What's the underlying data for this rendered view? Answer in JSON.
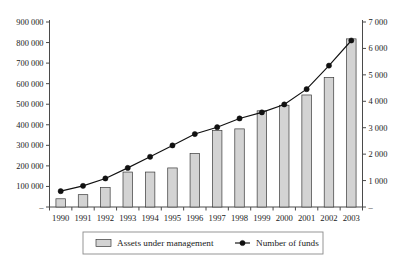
{
  "chart_data": {
    "type": "bar",
    "title": "",
    "subtitle": "",
    "xlabel": "",
    "ylabel": "",
    "grid": false,
    "legend_position": "bottom",
    "categories": [
      "1990",
      "1991",
      "1992",
      "1993",
      "1994",
      "1995",
      "1996",
      "1997",
      "1998",
      "1999",
      "2000",
      "2001",
      "2002",
      "2003"
    ],
    "left_axis": {
      "label": "",
      "ylim": [
        0,
        900000
      ],
      "tick_values": [
        0,
        100000,
        200000,
        300000,
        400000,
        500000,
        600000,
        700000,
        800000,
        900000
      ],
      "tick_labels": [
        "–",
        "100 000",
        "200 000",
        "300 000",
        "400 000",
        "500 000",
        "600 000",
        "700 000",
        "800 000",
        "900 000"
      ]
    },
    "right_axis": {
      "label": "",
      "ylim": [
        0,
        7000
      ],
      "tick_values": [
        0,
        1000,
        2000,
        3000,
        4000,
        5000,
        6000,
        7000
      ],
      "tick_labels": [
        "–",
        "1 000",
        "2 000",
        "3 000",
        "4 000",
        "5 000",
        "6 000",
        "7 000"
      ]
    },
    "series": [
      {
        "name": "Assets under management",
        "type": "bar",
        "axis": "left",
        "color": "#d3d3d3",
        "values": [
          40000,
          60000,
          95000,
          170000,
          170000,
          190000,
          260000,
          372000,
          380000,
          468000,
          495000,
          545000,
          630000,
          818000
        ]
      },
      {
        "name": "Number of funds",
        "type": "line",
        "axis": "right",
        "color": "#111111",
        "values": [
          600,
          800,
          1080,
          1480,
          1900,
          2330,
          2760,
          3020,
          3350,
          3580,
          3880,
          4460,
          5350,
          6300
        ]
      }
    ]
  },
  "legend": {
    "items": [
      {
        "label": "Assets under management",
        "marker": "bar-swatch"
      },
      {
        "label": "Number of funds",
        "marker": "line-point"
      }
    ]
  }
}
